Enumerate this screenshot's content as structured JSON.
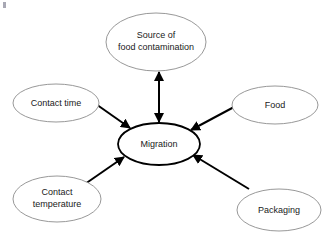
{
  "diagram": {
    "background_color": "#ffffff",
    "center_node": {
      "id": "migration",
      "label": "Migration",
      "cx": 159,
      "cy": 144,
      "rx": 41,
      "ry": 21,
      "stroke_color": "#000000",
      "stroke_width": 1.8,
      "fill_color": "#ffffff"
    },
    "nodes": [
      {
        "id": "source-of-food-contamination",
        "label_line1": "Source of",
        "label_line2": "food contamination",
        "cx": 156,
        "cy": 42,
        "rx": 50,
        "ry": 29,
        "stroke_color": "#8c8c8c",
        "fill_color": "#ffffff"
      },
      {
        "id": "contact-time",
        "label_line1": "Contact time",
        "label_line2": "",
        "cx": 56,
        "cy": 103,
        "rx": 43,
        "ry": 19,
        "stroke_color": "#8c8c8c",
        "fill_color": "#ffffff"
      },
      {
        "id": "food",
        "label_line1": "Food",
        "label_line2": "",
        "cx": 275,
        "cy": 105,
        "rx": 43,
        "ry": 19,
        "stroke_color": "#8c8c8c",
        "fill_color": "#ffffff"
      },
      {
        "id": "contact-temperature",
        "label_line1": "Contact",
        "label_line2": "temperature",
        "cx": 57,
        "cy": 199,
        "rx": 44,
        "ry": 23,
        "stroke_color": "#8c8c8c",
        "fill_color": "#ffffff"
      },
      {
        "id": "packaging",
        "label_line1": "Packaging",
        "label_line2": "",
        "cx": 279,
        "cy": 210,
        "rx": 42,
        "ry": 21,
        "stroke_color": "#8c8c8c",
        "fill_color": "#ffffff"
      }
    ],
    "connectors": [
      {
        "id": "migration-to-source",
        "from": "migration",
        "to": "source-of-food-contamination",
        "arrowheads": "both",
        "x1": 159,
        "y1": 122,
        "x2": 159,
        "y2": 72,
        "stroke_color": "#000000",
        "stroke_width": 2
      },
      {
        "id": "contact-time-to-migration",
        "from": "contact-time",
        "to": "migration",
        "arrowheads": "end",
        "x1": 93,
        "y1": 102,
        "x2": 130,
        "y2": 128,
        "stroke_color": "#000000",
        "stroke_width": 2
      },
      {
        "id": "food-to-migration",
        "from": "food",
        "to": "migration",
        "arrowheads": "end",
        "x1": 234,
        "y1": 107,
        "x2": 191,
        "y2": 130,
        "stroke_color": "#000000",
        "stroke_width": 2
      },
      {
        "id": "contact-temperature-to-migration",
        "from": "contact-temperature",
        "to": "migration",
        "arrowheads": "end",
        "x1": 85,
        "y1": 184,
        "x2": 124,
        "y2": 157,
        "stroke_color": "#000000",
        "stroke_width": 2
      },
      {
        "id": "packaging-to-migration",
        "from": "packaging",
        "to": "migration",
        "arrowheads": "end",
        "x1": 249,
        "y1": 189,
        "x2": 193,
        "y2": 155,
        "stroke_color": "#000000",
        "stroke_width": 2
      }
    ],
    "artifact": {
      "id": "corner-speck",
      "x": 3,
      "y": 2,
      "w": 3,
      "h": 6
    }
  }
}
